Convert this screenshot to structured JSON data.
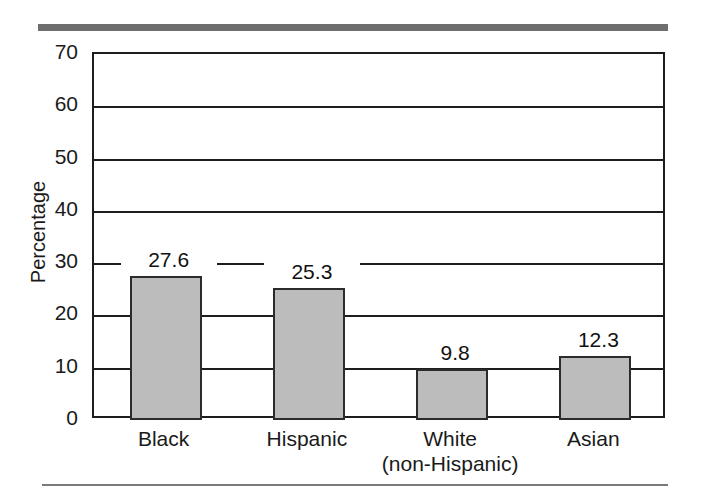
{
  "figure": {
    "top_rule_color": "#6e6e6e",
    "bottom_rule_color": "#7a7a7a",
    "background": "#ffffff"
  },
  "chart_data": {
    "type": "bar",
    "title": "",
    "subtitle": "",
    "xlabel": "",
    "ylabel": "Percentage",
    "categories": [
      "Black",
      "Hispanic",
      "White",
      "Asian"
    ],
    "category_sublabels": [
      "",
      "",
      "(non-Hispanic)",
      ""
    ],
    "values": [
      27.6,
      25.3,
      9.8,
      12.3
    ],
    "value_labels": [
      "27.6",
      "25.3",
      "9.8",
      "12.3"
    ],
    "ylim": [
      0,
      70
    ],
    "yticks": [
      70,
      60,
      50,
      40,
      30,
      20,
      10,
      0
    ],
    "ytick_labels": [
      "70",
      "60",
      "50",
      "40",
      "30",
      "20",
      "10",
      "0"
    ],
    "grid": true,
    "grid_axis": "y",
    "legend": false,
    "legend_position": "none",
    "bar_fill_color": "#bcbcbc",
    "bar_edge_color": "#2b2b2b",
    "axis_color": "#1d1d1d",
    "text_color": "#1a1a1a"
  }
}
